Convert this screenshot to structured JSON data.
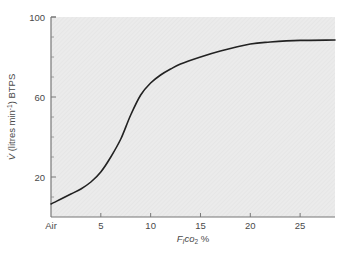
{
  "chart_data": {
    "type": "line",
    "title": "",
    "xlabel": "F_ICO2 %",
    "xlabel_parts": {
      "main": "F",
      "sub1": "I",
      "mid": "CO",
      "sub2": "2",
      "suffix": " %"
    },
    "ylabel": "V̇ (litres min⁻¹) BTPS",
    "ylabel_parts": {
      "symbol": "V̇",
      "text": " (litres min",
      "sup": "-1",
      "tail": ") BTPS"
    },
    "xlim": [
      0,
      28.5
    ],
    "ylim": [
      0,
      100
    ],
    "x_ticks": [
      {
        "value": 0,
        "label": "Air"
      },
      {
        "value": 5,
        "label": "5"
      },
      {
        "value": 10,
        "label": "10"
      },
      {
        "value": 15,
        "label": "15"
      },
      {
        "value": 20,
        "label": "20"
      },
      {
        "value": 25,
        "label": "25"
      }
    ],
    "y_ticks": [
      {
        "value": 20,
        "label": "20"
      },
      {
        "value": 60,
        "label": "60"
      },
      {
        "value": 100,
        "label": "100"
      }
    ],
    "y_minor_ticks": [
      10,
      30,
      40,
      50,
      70,
      80,
      90
    ],
    "grid": false,
    "legend": null,
    "background_color": "#e9e9e9",
    "line_color": "#222222",
    "series": [
      {
        "name": "Ventilation response to inspired CO2",
        "x": [
          0,
          1,
          2,
          3,
          4,
          5,
          6,
          7,
          8,
          9,
          10,
          11,
          12,
          13,
          15,
          17,
          20,
          22,
          25,
          28.5
        ],
        "values": [
          6.5,
          9,
          11.5,
          14,
          17.5,
          22.5,
          30,
          39,
          51,
          61,
          67,
          71,
          74,
          76.5,
          80,
          83,
          86.5,
          87.5,
          88.3,
          88.5
        ]
      }
    ]
  }
}
